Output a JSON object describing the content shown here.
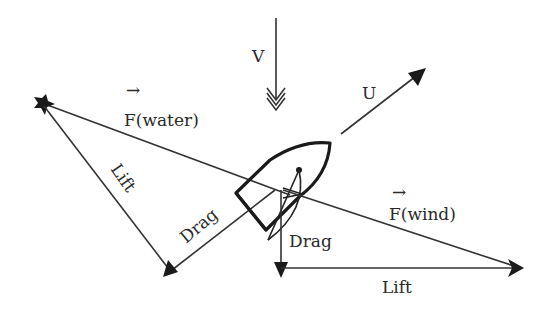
{
  "diagram": {
    "labels": {
      "V": "V",
      "U": "U",
      "F_water": "F(water)",
      "F_wind": "F(wind)",
      "lift_water": "Lift",
      "drag_water": "Drag",
      "drag_wind": "Drag",
      "lift_wind": "Lift",
      "vector_arrow": "→"
    },
    "nodes": [
      {
        "id": "boat",
        "label": "Sailboat hull with sail"
      },
      {
        "id": "water-force-tip",
        "label": "F(water) resultant tip"
      },
      {
        "id": "wind-force-tip",
        "label": "F(wind) resultant tip"
      }
    ],
    "edges": [
      {
        "id": "V",
        "label": "V",
        "meaning": "true wind velocity, pointing down"
      },
      {
        "id": "U",
        "label": "U",
        "meaning": "boat velocity, up-right"
      },
      {
        "id": "F_water",
        "label": "F(water)",
        "from": "boat",
        "to": "water-force-tip"
      },
      {
        "id": "lift_water",
        "label": "Lift",
        "from": "water-force-tip",
        "to": "water-triangle-corner"
      },
      {
        "id": "drag_water",
        "label": "Drag",
        "from": "boat",
        "to": "water-triangle-corner"
      },
      {
        "id": "F_wind",
        "label": "F(wind)",
        "from": "boat",
        "to": "wind-force-tip"
      },
      {
        "id": "drag_wind",
        "label": "Drag",
        "from": "boat",
        "to": "wind-triangle-corner"
      },
      {
        "id": "lift_wind",
        "label": "Lift",
        "from": "wind-triangle-corner",
        "to": "wind-force-tip"
      }
    ],
    "colors": {
      "line": "#333333",
      "background": "#ffffff"
    }
  }
}
